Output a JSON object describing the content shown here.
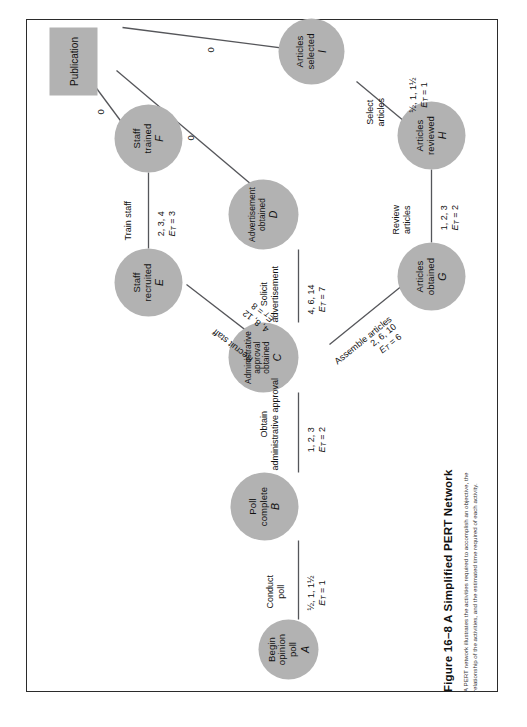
{
  "figure": {
    "caption_title": "Figure 16–8   A Simplified PERT Network",
    "caption_text": "A PERT network illustrates the activities required to accomplish an objective, the relationship of the activities, and the estimated time required of each activity."
  },
  "diagram": {
    "type": "pert-network",
    "node_fill": "#b2b2b2",
    "nodes": [
      {
        "id": "A",
        "shape": "circle",
        "label_line1": "Begin",
        "label_line2": "opinion",
        "label_line3": "poll",
        "letter": "A"
      },
      {
        "id": "B",
        "shape": "circle",
        "label_line1": "Poll",
        "label_line2": "complete",
        "label_line3": "",
        "letter": "B"
      },
      {
        "id": "C",
        "shape": "circle",
        "label_line1": "Administrative",
        "label_line2": "approval",
        "label_line3": "obtained",
        "letter": "C"
      },
      {
        "id": "D",
        "shape": "circle",
        "label_line1": "Advertisement",
        "label_line2": "obtained",
        "label_line3": "",
        "letter": "D"
      },
      {
        "id": "E",
        "shape": "circle",
        "label_line1": "Staff",
        "label_line2": "recruited",
        "label_line3": "",
        "letter": "E"
      },
      {
        "id": "F",
        "shape": "circle",
        "label_line1": "Staff",
        "label_line2": "trained",
        "label_line3": "",
        "letter": "F"
      },
      {
        "id": "G",
        "shape": "circle",
        "label_line1": "Articles",
        "label_line2": "obtained",
        "label_line3": "",
        "letter": "G"
      },
      {
        "id": "H",
        "shape": "circle",
        "label_line1": "Articles",
        "label_line2": "reviewed",
        "label_line3": "",
        "letter": "H"
      },
      {
        "id": "I",
        "shape": "circle",
        "label_line1": "Articles",
        "label_line2": "selected",
        "label_line3": "",
        "letter": "I"
      },
      {
        "id": "PUB",
        "shape": "rect",
        "label_line1": "Publication",
        "label_line2": "",
        "label_line3": "",
        "letter": ""
      }
    ],
    "edges": [
      {
        "from": "A",
        "to": "B",
        "activity_line1": "Conduct",
        "activity_line2": "poll",
        "estimates": "½, 1, 1½",
        "et": "1"
      },
      {
        "from": "B",
        "to": "C",
        "activity_line1": "Obtain",
        "activity_line2": "administrative approval",
        "estimates": "1, 2, 3",
        "et": "2"
      },
      {
        "from": "C",
        "to": "E",
        "activity_line1": "Recruit staff",
        "activity_line2": "",
        "estimates": "4, 8, 12",
        "et": "8"
      },
      {
        "from": "E",
        "to": "F",
        "activity_line1": "Train staff",
        "activity_line2": "",
        "estimates": "2, 3, 4",
        "et": "3"
      },
      {
        "from": "C",
        "to": "D",
        "activity_line1": "Solicit",
        "activity_line2": "advertisement",
        "estimates": "4, 6, 14",
        "et": "7"
      },
      {
        "from": "C",
        "to": "G",
        "activity_line1": "Assemble articles",
        "activity_line2": "",
        "estimates": "2, 6, 10",
        "et": "6"
      },
      {
        "from": "G",
        "to": "H",
        "activity_line1": "Review",
        "activity_line2": "articles",
        "estimates": "1, 2, 3",
        "et": "2"
      },
      {
        "from": "H",
        "to": "I",
        "activity_line1": "Select",
        "activity_line2": "articles",
        "estimates": "½, 1, 1½",
        "et": "1"
      },
      {
        "from": "F",
        "to": "PUB",
        "activity_line1": "",
        "activity_line2": "",
        "estimates": "",
        "et": "",
        "zero": "0"
      },
      {
        "from": "D",
        "to": "PUB",
        "activity_line1": "",
        "activity_line2": "",
        "estimates": "",
        "et": "",
        "zero": "0"
      },
      {
        "from": "I",
        "to": "PUB",
        "activity_line1": "",
        "activity_line2": "",
        "estimates": "",
        "et": "",
        "zero": "0"
      }
    ],
    "et_symbol": "E",
    "et_subscript": "T",
    "zero_labels": [
      "0",
      "0",
      "0"
    ]
  }
}
